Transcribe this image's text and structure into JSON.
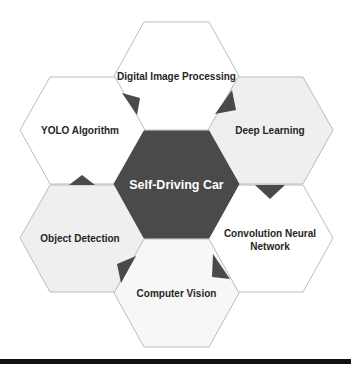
{
  "diagram": {
    "center": {
      "label": "Self-Driving Car",
      "fill": "#4a4a4a",
      "text_color": "#ffffff"
    },
    "nodes": [
      {
        "id": "top",
        "label": "Digital Image Processing",
        "fill": "#ffffff"
      },
      {
        "id": "upper-left",
        "label": "YOLO Algorithm",
        "fill": "#ffffff"
      },
      {
        "id": "upper-right",
        "label": "Deep Learning",
        "fill": "#efefef"
      },
      {
        "id": "lower-left",
        "label": "Object Detection",
        "fill": "#efefef"
      },
      {
        "id": "lower-right",
        "label_line1": "Convolution Neural",
        "label_line2": "Network",
        "fill": "#ffffff"
      },
      {
        "id": "bottom",
        "label": "Computer Vision",
        "fill": "#f7f7f7"
      }
    ],
    "colors": {
      "stroke": "#bdbdbd",
      "accent": "#4a4a4a",
      "rule": "#111111"
    }
  }
}
